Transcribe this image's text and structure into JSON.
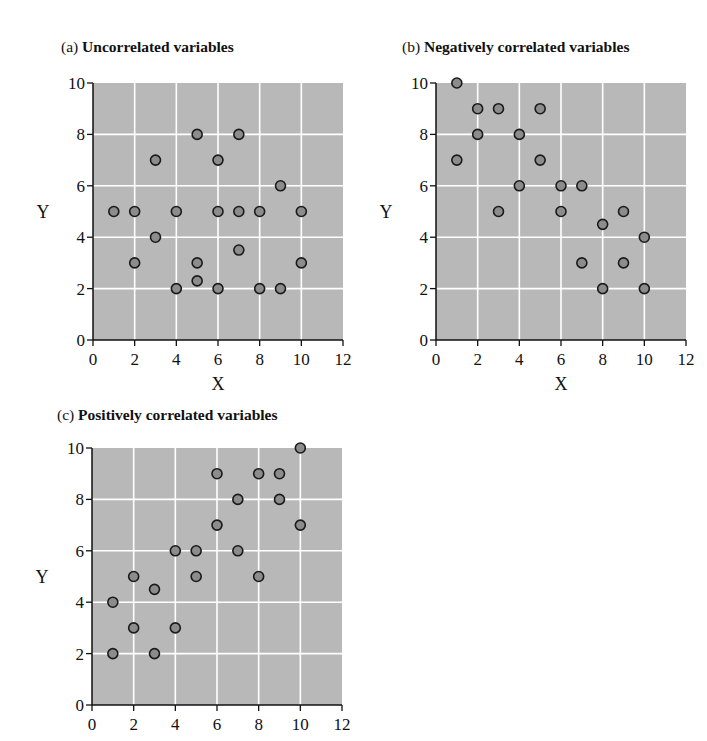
{
  "colors": {
    "plot_bg": "#b8b8b8",
    "grid": "#ffffff",
    "marker_fill": "#8c8c8c",
    "marker_stroke": "#1a1a1a",
    "axis": "#111111"
  },
  "chart_data": [
    {
      "id": "a",
      "type": "scatter",
      "label": "(a)",
      "title": "Uncorrelated variables",
      "xlabel": "X",
      "ylabel": "Y",
      "xlim": [
        0,
        12
      ],
      "ylim": [
        0,
        10
      ],
      "xticks": [
        0,
        2,
        4,
        6,
        8,
        10,
        12
      ],
      "yticks": [
        0,
        2,
        4,
        6,
        8,
        10
      ],
      "grid": true,
      "points": [
        [
          1,
          5
        ],
        [
          2,
          5
        ],
        [
          2,
          3
        ],
        [
          3,
          7
        ],
        [
          3,
          4
        ],
        [
          4,
          5
        ],
        [
          4,
          2
        ],
        [
          5,
          8
        ],
        [
          5,
          3
        ],
        [
          5,
          2.3
        ],
        [
          6,
          7
        ],
        [
          6,
          5
        ],
        [
          6,
          2
        ],
        [
          7,
          8
        ],
        [
          7,
          5
        ],
        [
          7,
          3.5
        ],
        [
          8,
          5
        ],
        [
          8,
          2
        ],
        [
          9,
          6
        ],
        [
          9,
          2
        ],
        [
          10,
          5
        ],
        [
          10,
          3
        ]
      ]
    },
    {
      "id": "b",
      "type": "scatter",
      "label": "(b)",
      "title": "Negatively correlated variables",
      "xlabel": "X",
      "ylabel": "Y",
      "xlim": [
        0,
        12
      ],
      "ylim": [
        0,
        10
      ],
      "xticks": [
        0,
        2,
        4,
        6,
        8,
        10,
        12
      ],
      "yticks": [
        0,
        2,
        4,
        6,
        8,
        10
      ],
      "grid": true,
      "points": [
        [
          1,
          10
        ],
        [
          1,
          7
        ],
        [
          2,
          9
        ],
        [
          2,
          8
        ],
        [
          3,
          9
        ],
        [
          3,
          5
        ],
        [
          4,
          8
        ],
        [
          4,
          6
        ],
        [
          5,
          9
        ],
        [
          5,
          7
        ],
        [
          6,
          6
        ],
        [
          6,
          5
        ],
        [
          7,
          6
        ],
        [
          7,
          3
        ],
        [
          8,
          4.5
        ],
        [
          8,
          2
        ],
        [
          9,
          5
        ],
        [
          9,
          3
        ],
        [
          10,
          4
        ],
        [
          10,
          2
        ]
      ]
    },
    {
      "id": "c",
      "type": "scatter",
      "label": "(c)",
      "title": "Positively correlated variables",
      "xlabel": "",
      "ylabel": "Y",
      "xlim": [
        0,
        12
      ],
      "ylim": [
        0,
        10
      ],
      "xticks": [
        0,
        2,
        4,
        6,
        8,
        10,
        12
      ],
      "yticks": [
        0,
        2,
        4,
        6,
        8,
        10
      ],
      "grid": true,
      "points": [
        [
          1,
          4
        ],
        [
          1,
          2
        ],
        [
          2,
          5
        ],
        [
          2,
          3
        ],
        [
          3,
          4.5
        ],
        [
          3,
          2
        ],
        [
          4,
          6
        ],
        [
          4,
          3
        ],
        [
          5,
          6
        ],
        [
          5,
          5
        ],
        [
          6,
          9
        ],
        [
          6,
          7
        ],
        [
          7,
          8
        ],
        [
          7,
          6
        ],
        [
          8,
          9
        ],
        [
          8,
          5
        ],
        [
          9,
          9
        ],
        [
          9,
          8
        ],
        [
          10,
          10
        ],
        [
          10,
          7
        ]
      ]
    }
  ]
}
